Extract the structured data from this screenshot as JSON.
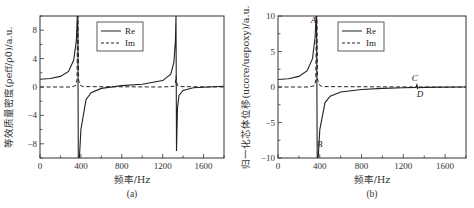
{
  "chart_data": [
    {
      "id": "a",
      "type": "line",
      "caption": "(a)",
      "title": "",
      "xlabel": "频率/Hz",
      "ylabel": "等效质量密度(ρ_eff/ρ_0)/a.u.",
      "xlim": [
        0,
        1800
      ],
      "ylim": [
        -10,
        10
      ],
      "xticks": [
        0,
        400,
        800,
        1200,
        1600
      ],
      "yticks": [
        8,
        4,
        0,
        -4,
        -8
      ],
      "grid": false,
      "legend": {
        "position": "upper center",
        "entries": [
          "Re",
          "Im"
        ]
      },
      "series": [
        {
          "name": "Re",
          "style": "solid",
          "x": [
            0,
            100,
            200,
            280,
            330,
            355,
            365,
            370,
            375,
            385,
            400,
            450,
            500,
            600,
            800,
            1000,
            1200,
            1280,
            1310,
            1325,
            1330,
            1335,
            1345,
            1360,
            1400,
            1500,
            1800
          ],
          "y": [
            1.1,
            1.2,
            1.5,
            2.2,
            3.8,
            6.5,
            10,
            10,
            -10,
            -10,
            -6,
            -1.8,
            -0.8,
            -0.2,
            0.2,
            0.4,
            0.9,
            1.8,
            3.5,
            6.5,
            10,
            -9,
            -3,
            -1.2,
            -0.5,
            -0.1,
            0.1
          ]
        },
        {
          "name": "Im",
          "style": "dashed",
          "x": [
            0,
            300,
            350,
            362,
            368,
            372,
            378,
            390,
            420,
            1200,
            1310,
            1325,
            1330,
            1335,
            1345,
            1380,
            1800
          ],
          "y": [
            0,
            0,
            0.2,
            1.0,
            10,
            10,
            1.0,
            0.3,
            0.05,
            0,
            0.1,
            0.5,
            1.5,
            0.8,
            0.2,
            0.05,
            0
          ]
        }
      ]
    },
    {
      "id": "b",
      "type": "line",
      "caption": "(b)",
      "title": "",
      "xlabel": "频率/Hz",
      "ylabel": "归一化芯体位移(u_core/u_epoxy)/a.u.",
      "xlim": [
        0,
        1800
      ],
      "ylim": [
        -10,
        10
      ],
      "xticks": [
        0,
        400,
        800,
        1200,
        1600
      ],
      "yticks": [
        10,
        5,
        0,
        -5,
        -10
      ],
      "grid": false,
      "legend": {
        "position": "upper center",
        "entries": [
          "Re",
          "Im"
        ]
      },
      "annotations": [
        {
          "label": "A",
          "x": 340,
          "y": 9
        },
        {
          "label": "B",
          "x": 400,
          "y": -8.5
        },
        {
          "label": "C",
          "x": 1310,
          "y": 0.8
        },
        {
          "label": "D",
          "x": 1360,
          "y": -1.4
        }
      ],
      "series": [
        {
          "name": "Re",
          "style": "solid",
          "x": [
            0,
            100,
            200,
            280,
            330,
            355,
            365,
            370,
            375,
            385,
            400,
            450,
            500,
            600,
            800,
            1000,
            1200,
            1320,
            1330,
            1335,
            1340,
            1400,
            1800
          ],
          "y": [
            1.05,
            1.15,
            1.5,
            2.3,
            4.0,
            7.0,
            10,
            10,
            -10,
            -10,
            -6,
            -2.2,
            -1.3,
            -0.7,
            -0.35,
            -0.2,
            -0.1,
            -0.05,
            0.3,
            -0.2,
            -0.1,
            -0.05,
            0
          ]
        },
        {
          "name": "Im",
          "style": "dashed",
          "x": [
            0,
            300,
            350,
            362,
            368,
            372,
            378,
            390,
            420,
            1320,
            1330,
            1335,
            1340,
            1800
          ],
          "y": [
            0,
            0,
            0.2,
            1.0,
            10,
            10,
            1.2,
            0.4,
            0.05,
            0,
            0.2,
            -0.15,
            0,
            0
          ]
        }
      ]
    }
  ],
  "panels": {
    "a": {
      "caption": "(a)",
      "xlabel": "频率/Hz",
      "ylabel": "等效质量密度(ρeff/ρ0)/a.u.",
      "xtick_labels": [
        "0",
        "400",
        "800",
        "1200",
        "1600"
      ],
      "ytick_labels": [
        "8",
        "4",
        "0",
        "−4",
        "−8"
      ],
      "legend": [
        "Re",
        "Im"
      ]
    },
    "b": {
      "caption": "(b)",
      "xlabel": "频率/Hz",
      "ylabel": "归一化芯体位移(ucore/uepoxy)/a.u.",
      "xtick_labels": [
        "0",
        "400",
        "800",
        "1200",
        "1600"
      ],
      "ytick_labels": [
        "10",
        "5",
        "0",
        "−5",
        "−10"
      ],
      "legend": [
        "Re",
        "Im"
      ],
      "annotations": [
        "A",
        "B",
        "C",
        "D"
      ]
    }
  },
  "colors": {
    "line": "#222222",
    "frame": "#333333"
  }
}
